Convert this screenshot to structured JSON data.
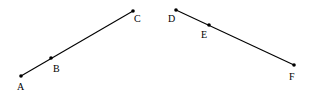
{
  "diagram": {
    "segments": [
      {
        "id": "ABC",
        "from": "A",
        "to": "C"
      },
      {
        "id": "DEF",
        "from": "D",
        "to": "F"
      }
    ],
    "points": [
      {
        "label": "A",
        "x": 21,
        "y": 76,
        "lx": 17,
        "ly": 90
      },
      {
        "label": "B",
        "x": 51,
        "y": 58,
        "lx": 53,
        "ly": 72
      },
      {
        "label": "C",
        "x": 133,
        "y": 11,
        "lx": 134,
        "ly": 22
      },
      {
        "label": "D",
        "x": 176,
        "y": 10,
        "lx": 168,
        "ly": 22
      },
      {
        "label": "E",
        "x": 209,
        "y": 25,
        "lx": 201,
        "ly": 38
      },
      {
        "label": "F",
        "x": 294,
        "y": 65,
        "lx": 289,
        "ly": 80
      }
    ],
    "colors": {
      "stroke": "#000000",
      "background": "#ffffff"
    }
  }
}
